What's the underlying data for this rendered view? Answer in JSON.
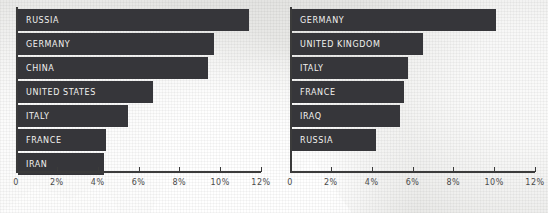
{
  "chart_data": [
    {
      "type": "bar",
      "orientation": "horizontal",
      "id": "left-chart",
      "title": "",
      "xlabel": "",
      "ylabel": "",
      "xlim": [
        0,
        12
      ],
      "grid": false,
      "legend": "none",
      "tick_labels": [
        "0",
        "2%",
        "4%",
        "6%",
        "8%",
        "10%",
        "12%"
      ],
      "tick_values": [
        0,
        2,
        4,
        6,
        8,
        10,
        12
      ],
      "categories": [
        "RUSSIA",
        "GERMANY",
        "CHINA",
        "UNITED STATES",
        "ITALY",
        "FRANCE",
        "IRAN"
      ],
      "values": [
        11.3,
        9.6,
        9.3,
        6.6,
        5.4,
        4.3,
        4.2
      ],
      "bar_color": "#36363a",
      "label_color": "#f2f2f0"
    },
    {
      "type": "bar",
      "orientation": "horizontal",
      "id": "right-chart",
      "title": "",
      "xlabel": "",
      "ylabel": "",
      "xlim": [
        0,
        12
      ],
      "grid": false,
      "legend": "none",
      "tick_labels": [
        "0",
        "2%",
        "4%",
        "6%",
        "8%",
        "10%",
        "12%"
      ],
      "tick_values": [
        0,
        2,
        4,
        6,
        8,
        10,
        12
      ],
      "categories": [
        "GERMANY",
        "UNITED KINGDOM",
        "ITALY",
        "FRANCE",
        "IRAQ",
        "RUSSIA"
      ],
      "values": [
        10.0,
        6.4,
        5.7,
        5.5,
        5.3,
        4.1
      ],
      "bar_color": "#36363a",
      "label_color": "#f2f2f0"
    }
  ],
  "theme": {
    "background": "#e9e9e7",
    "axis_color": "#3b3b3b",
    "tick_text_color": "#4a4a4a"
  }
}
